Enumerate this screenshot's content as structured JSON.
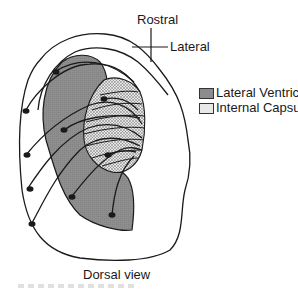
{
  "diagram": {
    "orientation": {
      "rostral_label": "Rostral",
      "lateral_label": "Lateral"
    },
    "legend": [
      {
        "label": "Lateral Ventricle",
        "fill": "#8c8c8c",
        "pattern": "solid-gray"
      },
      {
        "label": "Internal Capsule",
        "fill": "#e8e8e8",
        "pattern": "stippled"
      }
    ],
    "view_label": "Dorsal view",
    "colors": {
      "outline": "#1a1a1a",
      "lateral_ventricle": "#8c8c8c",
      "internal_capsule": "#e0e0e0",
      "background": "#ffffff"
    },
    "neuron_count": 9
  }
}
